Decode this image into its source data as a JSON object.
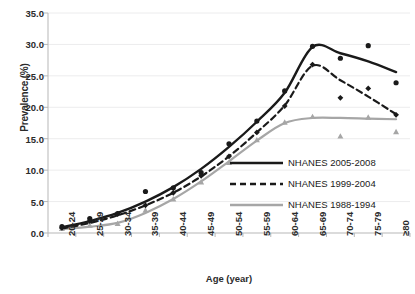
{
  "chart_data": {
    "type": "line",
    "title": "",
    "xlabel": "Age (year)",
    "ylabel": "Prevalence (%)",
    "ylim": [
      0,
      35
    ],
    "ytick_labels": [
      "0.0",
      "5.0",
      "10.0",
      "15.0",
      "20.0",
      "25.0",
      "30.0",
      "35.0"
    ],
    "ytick_values": [
      0,
      5,
      10,
      15,
      20,
      25,
      30,
      35
    ],
    "grid": "horizontal",
    "legend_position": "lower-right",
    "categories": [
      "20-24",
      "25-29",
      "30-34",
      "35-39",
      "40-44",
      "45-49",
      "50-54",
      "55-59",
      "60-64",
      "65-69",
      "70-74",
      "75-79",
      "≥80"
    ],
    "series": [
      {
        "name": "NHANES 2005-2008",
        "color": "#1a1a1a",
        "style": "solid",
        "marker": "circle",
        "values": [
          1.0,
          2.3,
          3.1,
          6.6,
          7.2,
          9.6,
          14.2,
          17.8,
          22.6,
          29.7,
          27.8,
          29.8,
          23.9
        ],
        "fit_values": [
          0.9,
          1.9,
          3.2,
          5.0,
          7.3,
          10.2,
          13.7,
          17.7,
          22.3,
          29.6,
          28.6,
          27.3,
          25.6
        ]
      },
      {
        "name": "NHANES 1999-2004",
        "color": "#1a1a1a",
        "style": "dashed",
        "marker": "diamond",
        "values": [
          0.8,
          1.9,
          3.0,
          4.4,
          6.4,
          9.1,
          12.2,
          16.0,
          20.2,
          26.8,
          21.5,
          23.0,
          18.8
        ],
        "fit_values": [
          0.7,
          1.6,
          2.8,
          4.4,
          6.4,
          9.0,
          12.2,
          16.0,
          20.3,
          26.6,
          24.3,
          21.7,
          18.9
        ]
      },
      {
        "name": "NHANES 1988-1994",
        "color": "#a6a6a6",
        "style": "solid",
        "marker": "triangle",
        "values": [
          0.7,
          1.2,
          1.5,
          3.6,
          5.4,
          8.1,
          11.2,
          14.8,
          17.6,
          18.5,
          15.4,
          18.4,
          16.1
        ],
        "fit_values": [
          0.6,
          1.0,
          1.6,
          3.2,
          5.4,
          8.2,
          11.4,
          14.7,
          17.5,
          18.3,
          18.3,
          18.2,
          18.1
        ]
      }
    ]
  },
  "legend": {
    "items": [
      {
        "label": "NHANES 2005-2008"
      },
      {
        "label": "NHANES 1999-2004"
      },
      {
        "label": "NHANES 1988-1994"
      }
    ]
  }
}
